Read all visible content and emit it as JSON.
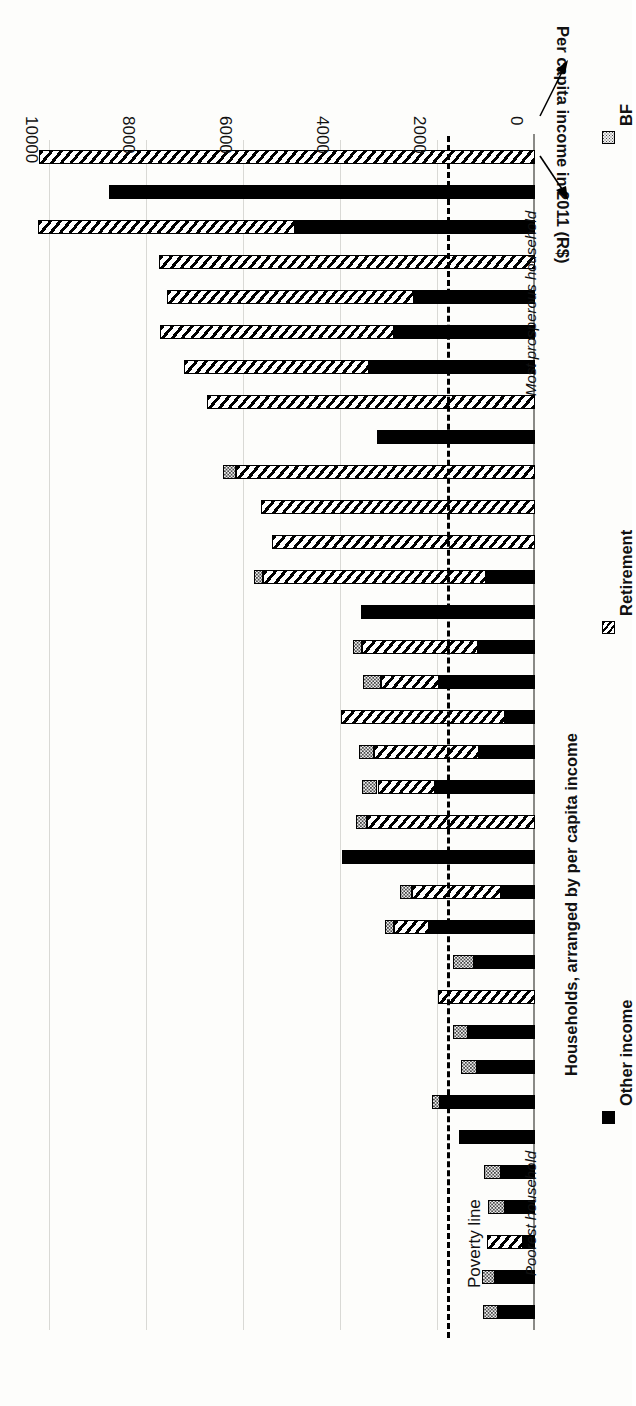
{
  "figure": {
    "orientation": "rotated-180",
    "value_axis_title": "Per capita income in 2011 (R$)",
    "category_axis_title": "Households, arranged by per capita income",
    "tick_labels": [
      "0",
      "2000",
      "4000",
      "6000",
      "8000",
      "10000"
    ],
    "annotations": {
      "poverty_line": "Poverty line",
      "poorest": "Poorest household",
      "most_prosperous": "Most prosperous household"
    }
  },
  "legend": {
    "items": [
      {
        "label": "BF",
        "pattern": "dotted",
        "color": "#efefef"
      },
      {
        "label": "Retirement",
        "pattern": "hatched",
        "color": "#ffffff"
      },
      {
        "label": "Other income",
        "pattern": "solid",
        "color": "#000000"
      }
    ]
  },
  "chart_data": {
    "type": "bar",
    "subtype": "stacked-horizontal",
    "title": "",
    "xlabel": "Households, arranged by per capita income",
    "ylabel": "Per capita income in 2011 (R$)",
    "ylim": [
      0,
      10400
    ],
    "ticks": [
      0,
      2000,
      4000,
      6000,
      8000,
      10000
    ],
    "grid": true,
    "legend_position": "bottom",
    "reference_lines": [
      {
        "label": "Poverty line",
        "value": 1750,
        "style": "dashed"
      }
    ],
    "categories": [
      "HH01",
      "HH02",
      "HH03",
      "HH04",
      "HH05",
      "HH06",
      "HH07",
      "HH08",
      "HH09",
      "HH10",
      "HH11",
      "HH12",
      "HH13",
      "HH14",
      "HH15",
      "HH16",
      "HH17",
      "HH18",
      "HH19",
      "HH20",
      "HH21",
      "HH22",
      "HH23",
      "HH24",
      "HH25",
      "HH26",
      "HH27",
      "HH28",
      "HH29",
      "HH30",
      "HH31",
      "HH32",
      "HH33",
      "HH34"
    ],
    "category_order": "poorest household first, most prosperous household last",
    "series": [
      {
        "name": "Other income",
        "pattern": "solid",
        "values": [
          760,
          820,
          240,
          620,
          700,
          1560,
          1970,
          1200,
          1380,
          0,
          1250,
          2180,
          700,
          3980,
          0,
          2060,
          1150,
          620,
          1980,
          1180,
          3600,
          1010,
          0,
          0,
          0,
          3260,
          0,
          3420,
          2900,
          2500,
          0,
          4950,
          8800,
          0
        ]
      },
      {
        "name": "Retirement",
        "pattern": "hatched",
        "values": [
          0,
          0,
          760,
          0,
          0,
          0,
          0,
          0,
          0,
          2000,
          0,
          720,
          1840,
          0,
          3470,
          1190,
          2180,
          3390,
          1200,
          2380,
          0,
          4600,
          5430,
          5660,
          6170,
          0,
          6760,
          3830,
          4830,
          5100,
          7760,
          5300,
          0,
          10230
        ]
      },
      {
        "name": "BF",
        "pattern": "dotted",
        "values": [
          320,
          280,
          0,
          340,
          360,
          0,
          160,
          330,
          320,
          0,
          440,
          200,
          250,
          0,
          220,
          330,
          310,
          0,
          360,
          200,
          0,
          180,
          0,
          0,
          260,
          0,
          0,
          0,
          0,
          0,
          0,
          0,
          0,
          0
        ]
      }
    ]
  }
}
